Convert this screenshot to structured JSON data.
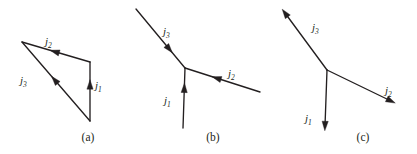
{
  "figure": {
    "background_color": "#ffffff",
    "ink_color": "#231f20",
    "width": 417,
    "height": 154
  },
  "panels": [
    {
      "id": "a",
      "caption": "(a)",
      "caption_x": 88,
      "caption_y": 141,
      "description": "Triangular loop of three current arrows",
      "labels": [
        {
          "name": "j1",
          "base": "j",
          "sub": "1",
          "x": 95,
          "y": 89
        },
        {
          "name": "j2",
          "base": "j",
          "sub": "2",
          "x": 45,
          "y": 45
        },
        {
          "name": "j3",
          "base": "j",
          "sub": "3",
          "x": 20,
          "y": 84
        }
      ],
      "segments": [
        {
          "name": "j1",
          "x1": 90,
          "y1": 121,
          "x2": 90,
          "y2": 62,
          "arrow_t": 0.62,
          "arrow_dir": "up"
        },
        {
          "name": "j2",
          "x1": 90,
          "y1": 62,
          "x2": 22,
          "y2": 42,
          "arrow_t": 0.52,
          "arrow_dir": "left"
        },
        {
          "name": "j3",
          "x1": 90,
          "y1": 121,
          "x2": 22,
          "y2": 42,
          "arrow_t": 0.52,
          "arrow_dir": "upleft"
        }
      ]
    },
    {
      "id": "b",
      "caption": "(b)",
      "caption_x": 213,
      "caption_y": 141,
      "description": "Three currents all flowing into a junction",
      "labels": [
        {
          "name": "j1",
          "base": "j",
          "sub": "1",
          "x": 164,
          "y": 104
        },
        {
          "name": "j2",
          "base": "j",
          "sub": "2",
          "x": 228,
          "y": 77
        },
        {
          "name": "j3",
          "base": "j",
          "sub": "3",
          "x": 163,
          "y": 35
        }
      ],
      "segments": [
        {
          "name": "j1",
          "x1": 183,
          "y1": 128,
          "x2": 185,
          "y2": 68,
          "arrow_t": 0.67,
          "arrow_dir": "up"
        },
        {
          "name": "j2",
          "x1": 260,
          "y1": 92,
          "x2": 185,
          "y2": 68,
          "arrow_t": 0.58,
          "arrow_dir": "left"
        },
        {
          "name": "j3",
          "x1": 136,
          "y1": 9,
          "x2": 185,
          "y2": 68,
          "arrow_t": 0.68,
          "arrow_dir": "downright"
        }
      ]
    },
    {
      "id": "c",
      "caption": "(c)",
      "caption_x": 363,
      "caption_y": 141,
      "description": "Three currents all flowing out of a junction",
      "labels": [
        {
          "name": "j1",
          "base": "j",
          "sub": "1",
          "x": 305,
          "y": 122
        },
        {
          "name": "j2",
          "base": "j",
          "sub": "2",
          "x": 385,
          "y": 94
        },
        {
          "name": "j3",
          "base": "j",
          "sub": "3",
          "x": 312,
          "y": 31
        }
      ],
      "segments": [
        {
          "name": "j1",
          "x1": 327,
          "y1": 70,
          "x2": 325,
          "y2": 126,
          "arrow_t": 1.0,
          "arrow_dir": "down"
        },
        {
          "name": "j2",
          "x1": 327,
          "y1": 70,
          "x2": 391,
          "y2": 101,
          "arrow_t": 1.0,
          "arrow_dir": "downright"
        },
        {
          "name": "j3",
          "x1": 327,
          "y1": 70,
          "x2": 285,
          "y2": 13,
          "arrow_t": 1.0,
          "arrow_dir": "upleft"
        }
      ]
    }
  ]
}
